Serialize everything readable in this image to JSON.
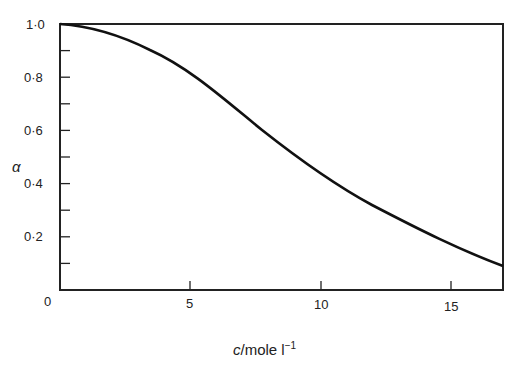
{
  "chart_data": {
    "type": "line",
    "title": "",
    "xlabel": "c/mole l⁻¹",
    "ylabel": "α",
    "xlim": [
      0,
      17
    ],
    "ylim": [
      0,
      1.0
    ],
    "grid": false,
    "legend": null,
    "x_ticks": [
      "0",
      "5",
      "10",
      "15"
    ],
    "y_ticks": [
      "0",
      "0·2",
      "0·4",
      "0·6",
      "0·8",
      "1·0"
    ],
    "series": [
      {
        "name": "alpha",
        "x": [
          0,
          1,
          2.5,
          5,
          7.5,
          10,
          12.5,
          15,
          17
        ],
        "y": [
          1.0,
          0.99,
          0.95,
          0.83,
          0.67,
          0.5,
          0.36,
          0.22,
          0.09
        ]
      }
    ]
  },
  "labels": {
    "x_axis": "c/mole l",
    "x_axis_sup": "−1",
    "y_axis": "α",
    "origin": "0",
    "x5": "5",
    "x10": "10",
    "x15": "15",
    "y02": "0·2",
    "y04": "0·4",
    "y06": "0·6",
    "y08": "0·8",
    "y10": "1·0"
  }
}
